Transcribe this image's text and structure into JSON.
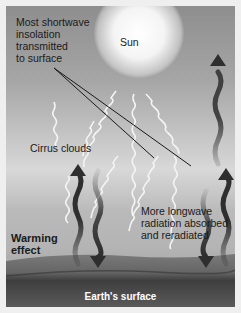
{
  "diagram": {
    "title_hidden": "Cirrus cloud warming effect",
    "labels": {
      "shortwave": [
        "Most shortwave",
        "insolation",
        "transmitted",
        "to surface"
      ],
      "sun": "Sun",
      "cirrus": "Cirrus clouds",
      "longwave": [
        "More longwave",
        "radiation absorbed",
        "and reradiated"
      ],
      "warming": [
        "Warming",
        "effect"
      ],
      "surface": "Earth's surface"
    },
    "colors": {
      "sky_top": "#8e8e8e",
      "sky_mid": "#c8c8c8",
      "ground": "#6e6e6e",
      "ground_dark": "#3a3a3a",
      "longwave_arrow": "#2e2e2e",
      "shortwave_wave": "#f2f2f2",
      "leader_line": "#1a1a1a"
    }
  }
}
